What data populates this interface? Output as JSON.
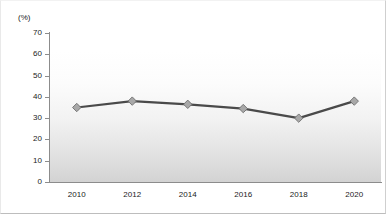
{
  "chart_data": {
    "type": "line",
    "title": "",
    "subtitle": "",
    "xlabel": "",
    "ylabel": "",
    "unit_label": "(%)",
    "categories": [
      "2010",
      "2012",
      "2014",
      "2016",
      "2018",
      "2020"
    ],
    "values": [
      35,
      38,
      36.5,
      34.5,
      30,
      38
    ],
    "series": [
      {
        "name": "",
        "values": [
          35,
          38,
          36.5,
          34.5,
          30,
          38
        ]
      }
    ],
    "ylim": [
      0,
      70
    ],
    "ytick_step": 10,
    "yticks": [
      0,
      10,
      20,
      30,
      40,
      50,
      60,
      70
    ],
    "ytick_labels": [
      "0",
      "10",
      "20",
      "30",
      "40",
      "50",
      "60",
      "70"
    ],
    "xlim_labels": [
      "2010",
      "2020"
    ],
    "grid": false,
    "legend": "none",
    "annotations": [],
    "colors": {
      "line": "#4a4a4a",
      "marker_fill": "#a8a8a8",
      "marker_stroke": "#6e6e6e",
      "axis": "#8c8c8c",
      "text": "#1b1b1b",
      "background": "#ffffff",
      "wash": "#969696"
    },
    "marker_shape": "diamond"
  }
}
